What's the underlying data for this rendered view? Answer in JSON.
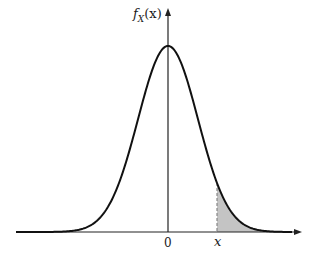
{
  "figure": {
    "type": "normal-distribution-tail-area",
    "y_axis_label": {
      "func": "f",
      "sub": "X",
      "arg": "(x)"
    },
    "x_axis_ticks": {
      "origin": "0",
      "threshold": "x"
    },
    "colors": {
      "curve": "#111111",
      "axis": "#222222",
      "shade": "#c4c4c4",
      "dashed": "#888888"
    },
    "geometry": {
      "origin_px": [
        168,
        232
      ],
      "peak_height_px": 186,
      "sigma_px": 30,
      "threshold_px": 217,
      "x_axis_px": [
        16,
        302
      ],
      "y_axis_top_px": 8
    }
  },
  "chart_data": {
    "type": "area",
    "title": "",
    "xlabel": "",
    "ylabel": "f_X(x)",
    "x_ticks": [
      "0",
      "x"
    ],
    "curve": "normal pdf, mean 0",
    "shaded_region": "x to +infinity",
    "threshold_in_sigma": 1.63
  }
}
